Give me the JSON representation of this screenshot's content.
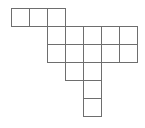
{
  "diagram": {
    "type": "polyomino-grid",
    "cell_size": 18,
    "origin": {
      "x": 11,
      "y": 8
    },
    "line_color": "#6e6e6e",
    "cells": [
      {
        "row": 0,
        "col": 0
      },
      {
        "row": 0,
        "col": 1
      },
      {
        "row": 0,
        "col": 2
      },
      {
        "row": 1,
        "col": 2
      },
      {
        "row": 1,
        "col": 3
      },
      {
        "row": 1,
        "col": 4
      },
      {
        "row": 1,
        "col": 5
      },
      {
        "row": 1,
        "col": 6
      },
      {
        "row": 2,
        "col": 2
      },
      {
        "row": 2,
        "col": 3
      },
      {
        "row": 2,
        "col": 4
      },
      {
        "row": 2,
        "col": 5
      },
      {
        "row": 2,
        "col": 6
      },
      {
        "row": 3,
        "col": 3
      },
      {
        "row": 3,
        "col": 4
      },
      {
        "row": 4,
        "col": 4
      },
      {
        "row": 5,
        "col": 4
      }
    ]
  }
}
